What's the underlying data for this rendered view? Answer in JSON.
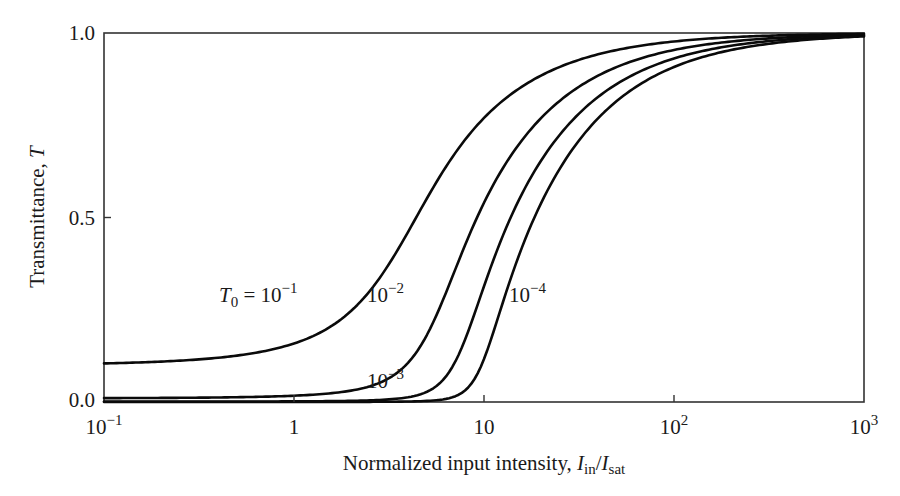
{
  "chart_data": {
    "type": "line",
    "title": "",
    "xlabel": "Normalized input intensity, I_in / I_sat",
    "ylabel": "Transmittance, T",
    "xscale": "log",
    "xlim": [
      0.1,
      1000
    ],
    "ylim": [
      0.0,
      1.0
    ],
    "grid": false,
    "legend": "none (inline curve annotations)",
    "x_ticks": [
      {
        "value": 0.1,
        "base": "10",
        "exp": "−1",
        "plain": ""
      },
      {
        "value": 1,
        "base": "1",
        "exp": "",
        "plain": "1"
      },
      {
        "value": 10,
        "base": "10",
        "exp": "",
        "plain": "10"
      },
      {
        "value": 100,
        "base": "10",
        "exp": "2",
        "plain": ""
      },
      {
        "value": 1000,
        "base": "10",
        "exp": "3",
        "plain": ""
      }
    ],
    "y_ticks": [
      {
        "value": 0.0,
        "label": "0.0"
      },
      {
        "value": 0.5,
        "label": "0.5"
      },
      {
        "value": 1.0,
        "label": "1.0"
      }
    ],
    "series": [
      {
        "name": "T0 = 10^-1",
        "T0": 0.1,
        "x": [
          0.1,
          0.2,
          0.5,
          1,
          2,
          3,
          5,
          7,
          10,
          20,
          30,
          50,
          100,
          200,
          500,
          1000
        ],
        "y": [
          0.105,
          0.11,
          0.126,
          0.159,
          0.247,
          0.356,
          0.551,
          0.672,
          0.77,
          0.885,
          0.923,
          0.954,
          0.977,
          0.989,
          0.995,
          0.998
        ]
      },
      {
        "name": "T0 = 10^-2",
        "T0": 0.01,
        "x": [
          0.1,
          0.5,
          1,
          2,
          3,
          5,
          7,
          10,
          15,
          20,
          30,
          50,
          100,
          200,
          500,
          1000
        ],
        "y": [
          0.011,
          0.013,
          0.017,
          0.031,
          0.058,
          0.181,
          0.355,
          0.54,
          0.693,
          0.77,
          0.847,
          0.908,
          0.954,
          0.977,
          0.991,
          0.995
        ]
      },
      {
        "name": "T0 = 10^-3",
        "T0": 0.001,
        "x": [
          0.1,
          1,
          2,
          3,
          4,
          5,
          7,
          10,
          15,
          20,
          30,
          50,
          100,
          200,
          500,
          1000
        ],
        "y": [
          0.001,
          0.002,
          0.003,
          0.006,
          0.013,
          0.028,
          0.106,
          0.314,
          0.54,
          0.655,
          0.77,
          0.862,
          0.931,
          0.966,
          0.986,
          0.993
        ]
      },
      {
        "name": "T0 = 10^-4",
        "T0": 0.0001,
        "x": [
          0.1,
          1,
          3,
          5,
          6,
          7,
          8.5,
          10,
          15,
          20,
          30,
          50,
          100,
          200,
          500,
          1000
        ],
        "y": [
          0.0001,
          0.0002,
          0.0006,
          0.003,
          0.007,
          0.015,
          0.045,
          0.116,
          0.386,
          0.54,
          0.693,
          0.816,
          0.908,
          0.954,
          0.982,
          0.991
        ]
      }
    ],
    "annotations": [
      {
        "id": "a1",
        "prefix": "T",
        "sub": "0",
        "mid": " = 10",
        "sup": "−1",
        "x_px": 219,
        "y_px": 302
      },
      {
        "id": "a2",
        "prefix": "",
        "sub": "",
        "mid": "10",
        "sup": "−2",
        "x_px": 367,
        "y_px": 302
      },
      {
        "id": "a3",
        "prefix": "",
        "sub": "",
        "mid": "10",
        "sup": "−3",
        "x_px": 367,
        "y_px": 388
      },
      {
        "id": "a4",
        "prefix": "",
        "sub": "",
        "mid": "10",
        "sup": "−4",
        "x_px": 509,
        "y_px": 302
      }
    ]
  },
  "axis_text": {
    "x_label_main": "Normalized input intensity, ",
    "x_label_I": "I",
    "x_label_in": "in",
    "x_label_slash": "/",
    "x_label_I2": "I",
    "x_label_sat": "sat",
    "y_label_main": "Transmittance, ",
    "y_label_T": "T"
  }
}
